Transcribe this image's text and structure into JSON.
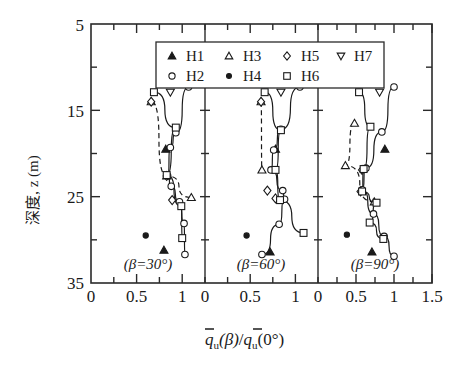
{
  "chart_data": {
    "type": "scatter",
    "title": "",
    "xlabel": "q̄u(β)/q̄u(0°)",
    "ylabel": "深度, z (m)",
    "ylim": [
      5,
      35
    ],
    "y_inverted": true,
    "y_ticks_major": [
      5,
      15,
      25,
      35
    ],
    "y_ticks_minor": [
      10,
      20,
      30
    ],
    "grid": false,
    "legend_position": "top-center",
    "panels": [
      {
        "label": "(β=30°)",
        "xlim": [
          0,
          1.25
        ],
        "x_ticks": [
          "0",
          "0.5",
          "1"
        ],
        "x_tick_values": [
          0,
          0.5,
          1
        ],
        "series": [
          {
            "name": "H1",
            "marker": "filled-triangle-up",
            "x": [
              0.82,
              0.8
            ],
            "y": [
              19.5,
              31.2
            ],
            "line": "none"
          },
          {
            "name": "H2",
            "marker": "open-circle",
            "x": [
              1.07,
              0.93,
              0.87,
              0.84,
              0.88,
              0.97,
              1.02,
              1.03
            ],
            "y": [
              12.3,
              17.6,
              19.3,
              22.6,
              23.8,
              25.6,
              28.1,
              31.7
            ],
            "line": "solid"
          },
          {
            "name": "H3",
            "marker": "open-triangle-up",
            "x": [
              0.66,
              0.83,
              1.1
            ],
            "y": [
              14.0,
              22.6,
              25.1
            ],
            "line": "dashed"
          },
          {
            "name": "H4",
            "marker": "filled-circle",
            "x": [
              0.6
            ],
            "y": [
              29.5
            ],
            "line": "none"
          },
          {
            "name": "H5",
            "marker": "open-diamond",
            "x": [
              0.66,
              0.83,
              0.89
            ],
            "y": [
              14.0,
              22.6,
              25.4
            ],
            "line": "none"
          },
          {
            "name": "H6",
            "marker": "open-square",
            "x": [
              0.69,
              0.93,
              0.83,
              0.99,
              1.0
            ],
            "y": [
              12.9,
              17.0,
              22.5,
              26.1,
              29.8
            ],
            "line": "solid"
          },
          {
            "name": "H7",
            "marker": "open-triangle-down",
            "x": [
              0.87
            ],
            "y": [
              12.9
            ],
            "line": "none"
          }
        ]
      },
      {
        "label": "(β=60°)",
        "xlim": [
          0,
          1.25
        ],
        "x_ticks": [
          "0",
          "0.5",
          "1"
        ],
        "x_tick_values": [
          0,
          0.5,
          1
        ],
        "series": [
          {
            "name": "H1",
            "marker": "filled-triangle-up",
            "x": [
              0.78,
              0.72
            ],
            "y": [
              19.5,
              31.4
            ],
            "line": "none"
          },
          {
            "name": "H2",
            "marker": "open-circle",
            "x": [
              1.05,
              0.84,
              0.76,
              0.73,
              0.86,
              0.88,
              0.82,
              0.63
            ],
            "y": [
              12.3,
              17.2,
              19.6,
              21.9,
              24.3,
              25.3,
              28.2,
              31.7
            ],
            "line": "solid"
          },
          {
            "name": "H3",
            "marker": "open-triangle-up",
            "x": [
              0.62,
              0.63
            ],
            "y": [
              14.0,
              21.9
            ],
            "line": "dashed"
          },
          {
            "name": "H4",
            "marker": "filled-circle",
            "x": [
              0.46
            ],
            "y": [
              29.5
            ],
            "line": "none"
          },
          {
            "name": "H5",
            "marker": "open-diamond",
            "x": [
              0.62,
              0.69,
              0.78
            ],
            "y": [
              14.0,
              24.3,
              25.2
            ],
            "line": "none"
          },
          {
            "name": "H6",
            "marker": "open-square",
            "x": [
              0.66,
              0.84,
              0.78,
              0.83,
              1.09
            ],
            "y": [
              12.9,
              17.3,
              21.9,
              25.4,
              29.2
            ],
            "line": "solid"
          },
          {
            "name": "H7",
            "marker": "open-triangle-down",
            "x": [
              0.84
            ],
            "y": [
              12.9
            ],
            "line": "none"
          }
        ]
      },
      {
        "label": "(β=90°)",
        "xlim": [
          0,
          1.5
        ],
        "x_ticks": [
          "0",
          "0.5",
          "1",
          "1.5"
        ],
        "x_tick_values": [
          0,
          0.5,
          1,
          1.5
        ],
        "series": [
          {
            "name": "H1",
            "marker": "filled-triangle-up",
            "x": [
              0.88,
              0.71
            ],
            "y": [
              19.5,
              31.4
            ],
            "line": "none"
          },
          {
            "name": "H2",
            "marker": "open-circle",
            "x": [
              1.0,
              0.84,
              0.63,
              0.58,
              0.73,
              0.87,
              1.0
            ],
            "y": [
              12.3,
              17.5,
              21.7,
              24.2,
              27.0,
              29.6,
              31.9
            ],
            "line": "solid"
          },
          {
            "name": "H3",
            "marker": "open-triangle-up",
            "x": [
              0.48,
              0.36,
              0.74
            ],
            "y": [
              16.5,
              21.4,
              25.6
            ],
            "line": "dashed"
          },
          {
            "name": "H4",
            "marker": "filled-circle",
            "x": [
              0.38
            ],
            "y": [
              29.4
            ],
            "line": "none"
          },
          {
            "name": "H5",
            "marker": "open-diamond",
            "x": [
              0.58,
              0.56
            ],
            "y": [
              21.9,
              24.4
            ],
            "line": "none"
          },
          {
            "name": "H6",
            "marker": "open-square",
            "x": [
              0.54,
              0.69,
              0.6,
              0.58,
              0.77,
              0.68,
              0.86
            ],
            "y": [
              12.9,
              16.9,
              21.8,
              24.4,
              25.7,
              28.0,
              29.9
            ],
            "line": "solid"
          },
          {
            "name": "H7",
            "marker": "open-triangle-down",
            "x": [
              0.81
            ],
            "y": [
              12.9
            ],
            "line": "none"
          }
        ]
      }
    ],
    "legend": [
      {
        "label": "H1",
        "marker": "filled-triangle-up"
      },
      {
        "label": "H3",
        "marker": "open-triangle-up"
      },
      {
        "label": "H5",
        "marker": "open-diamond"
      },
      {
        "label": "H7",
        "marker": "open-triangle-down"
      },
      {
        "label": "H2",
        "marker": "open-circle"
      },
      {
        "label": "H4",
        "marker": "filled-circle"
      },
      {
        "label": "H6",
        "marker": "open-square"
      }
    ]
  },
  "axis": {
    "y_label_text": "深度, z (m)",
    "y_tick_5": "5",
    "y_tick_15": "15",
    "y_tick_25": "25",
    "y_tick_35": "35",
    "x_title_q": "q",
    "x_title_sub": "u",
    "x_title_beta": "(β)",
    "x_title_slash": "/",
    "x_title_zero": "(0°)"
  },
  "xtick_labels": {
    "p1": [
      "0",
      "0.5",
      "1"
    ],
    "p2": [
      "0",
      "0.5",
      "1"
    ],
    "p3": [
      "0",
      "0.5",
      "1",
      "1.5"
    ]
  },
  "panel_labels": {
    "p1": "(β=30°)",
    "p2": "(β=60°)",
    "p3": "(β=90°)"
  },
  "legend_labels": {
    "h1": "H1",
    "h2": "H2",
    "h3": "H3",
    "h4": "H4",
    "h5": "H5",
    "h6": "H6",
    "h7": "H7"
  },
  "colors": {
    "ink": "#1a1a1a",
    "axis": "#2a2a2a",
    "paper": "#ffffff"
  }
}
